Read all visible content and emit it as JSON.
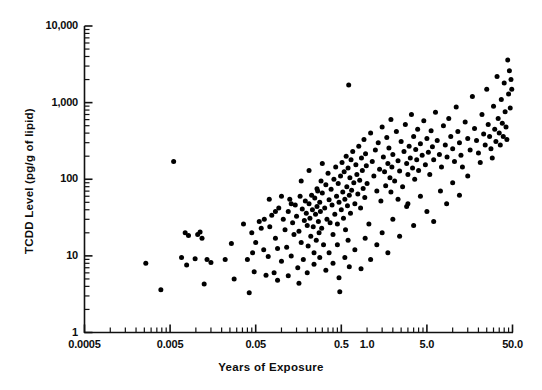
{
  "chart_data": {
    "type": "scatter",
    "title": "",
    "xlabel": "Years of Exposure",
    "ylabel": "TCDD Level (pg/g of lipid)",
    "xscale": "log",
    "yscale": "log",
    "xlim": [
      0.0005,
      50.0
    ],
    "ylim": [
      1,
      10000
    ],
    "grid": false,
    "legend": null,
    "marker": {
      "shape": "circle",
      "color": "#000000",
      "size_px": 5
    },
    "xticks": [
      {
        "value": 0.0005,
        "label": "0.0005"
      },
      {
        "value": 0.005,
        "label": "0.005"
      },
      {
        "value": 0.05,
        "label": "0.05"
      },
      {
        "value": 0.5,
        "label": "0.5"
      },
      {
        "value": 1.0,
        "label": "1.0"
      },
      {
        "value": 5.0,
        "label": "5.0"
      },
      {
        "value": 50.0,
        "label": "50.0"
      }
    ],
    "yticks": [
      {
        "value": 1,
        "label": "1"
      },
      {
        "value": 10,
        "label": "10"
      },
      {
        "value": 100,
        "label": "100"
      },
      {
        "value": 1000,
        "label": "1,000"
      },
      {
        "value": 10000,
        "label": "10,000"
      }
    ],
    "points": [
      [
        0.0026,
        8.0
      ],
      [
        0.0039,
        3.6
      ],
      [
        0.0055,
        170
      ],
      [
        0.0068,
        9.5
      ],
      [
        0.0075,
        20
      ],
      [
        0.0078,
        7.6
      ],
      [
        0.0082,
        18.5
      ],
      [
        0.0098,
        9.2
      ],
      [
        0.0105,
        19
      ],
      [
        0.0112,
        20.5
      ],
      [
        0.0118,
        17
      ],
      [
        0.0125,
        4.3
      ],
      [
        0.0135,
        9.0
      ],
      [
        0.015,
        8.2
      ],
      [
        0.022,
        9.0
      ],
      [
        0.026,
        14.5
      ],
      [
        0.028,
        5.0
      ],
      [
        0.036,
        26
      ],
      [
        0.04,
        9.0
      ],
      [
        0.042,
        3.3
      ],
      [
        0.045,
        20
      ],
      [
        0.046,
        11
      ],
      [
        0.048,
        6.2
      ],
      [
        0.05,
        15
      ],
      [
        0.055,
        28
      ],
      [
        0.058,
        23
      ],
      [
        0.062,
        12
      ],
      [
        0.063,
        30
      ],
      [
        0.066,
        5.6
      ],
      [
        0.07,
        9.8
      ],
      [
        0.073,
        24
      ],
      [
        0.077,
        34
      ],
      [
        0.082,
        6.0
      ],
      [
        0.085,
        17
      ],
      [
        0.09,
        12.5
      ],
      [
        0.093,
        42
      ],
      [
        0.1,
        8.5
      ],
      [
        0.105,
        30
      ],
      [
        0.11,
        22
      ],
      [
        0.115,
        13
      ],
      [
        0.12,
        38
      ],
      [
        0.125,
        55
      ],
      [
        0.13,
        10
      ],
      [
        0.135,
        27
      ],
      [
        0.14,
        19
      ],
      [
        0.145,
        46
      ],
      [
        0.15,
        33
      ],
      [
        0.155,
        7.0
      ],
      [
        0.16,
        21
      ],
      [
        0.165,
        60
      ],
      [
        0.17,
        15
      ],
      [
        0.175,
        41
      ],
      [
        0.18,
        9.0
      ],
      [
        0.185,
        29
      ],
      [
        0.19,
        52
      ],
      [
        0.195,
        36
      ],
      [
        0.2,
        25
      ],
      [
        0.205,
        13.5
      ],
      [
        0.21,
        48
      ],
      [
        0.215,
        31
      ],
      [
        0.22,
        18
      ],
      [
        0.225,
        62
      ],
      [
        0.23,
        40
      ],
      [
        0.235,
        24
      ],
      [
        0.24,
        11
      ],
      [
        0.245,
        57
      ],
      [
        0.25,
        35
      ],
      [
        0.255,
        16
      ],
      [
        0.26,
        44
      ],
      [
        0.265,
        70
      ],
      [
        0.27,
        28
      ],
      [
        0.275,
        20
      ],
      [
        0.28,
        50
      ],
      [
        0.285,
        38
      ],
      [
        0.29,
        95
      ],
      [
        0.295,
        23
      ],
      [
        0.3,
        66
      ],
      [
        0.31,
        14
      ],
      [
        0.32,
        42
      ],
      [
        0.33,
        85
      ],
      [
        0.34,
        30
      ],
      [
        0.35,
        120
      ],
      [
        0.36,
        54
      ],
      [
        0.37,
        27
      ],
      [
        0.38,
        74
      ],
      [
        0.39,
        46
      ],
      [
        0.4,
        19
      ],
      [
        0.41,
        100
      ],
      [
        0.42,
        35
      ],
      [
        0.43,
        145
      ],
      [
        0.44,
        60
      ],
      [
        0.45,
        26
      ],
      [
        0.46,
        88
      ],
      [
        0.47,
        50
      ],
      [
        0.48,
        3.4
      ],
      [
        0.49,
        110
      ],
      [
        0.5,
        40
      ],
      [
        0.51,
        165
      ],
      [
        0.52,
        68
      ],
      [
        0.53,
        31
      ],
      [
        0.54,
        125
      ],
      [
        0.55,
        55
      ],
      [
        0.56,
        22
      ],
      [
        0.57,
        200
      ],
      [
        0.58,
        80
      ],
      [
        0.59,
        45
      ],
      [
        0.6,
        140
      ],
      [
        0.61,
        1700
      ],
      [
        0.62,
        62
      ],
      [
        0.63,
        105
      ],
      [
        0.64,
        36
      ],
      [
        0.65,
        180
      ],
      [
        0.66,
        72
      ],
      [
        0.68,
        230
      ],
      [
        0.7,
        90
      ],
      [
        0.72,
        48
      ],
      [
        0.74,
        155
      ],
      [
        0.76,
        115
      ],
      [
        0.78,
        64
      ],
      [
        0.8,
        270
      ],
      [
        0.82,
        97
      ],
      [
        0.84,
        42
      ],
      [
        0.86,
        190
      ],
      [
        0.88,
        130
      ],
      [
        0.9,
        76
      ],
      [
        0.92,
        330
      ],
      [
        0.94,
        58
      ],
      [
        0.96,
        215
      ],
      [
        0.98,
        150
      ],
      [
        1.0,
        88
      ],
      [
        1.05,
        26
      ],
      [
        1.1,
        400
      ],
      [
        1.15,
        170
      ],
      [
        1.2,
        110
      ],
      [
        1.25,
        240
      ],
      [
        1.3,
        70
      ],
      [
        1.35,
        300
      ],
      [
        1.4,
        135
      ],
      [
        1.45,
        52
      ],
      [
        1.5,
        480
      ],
      [
        1.55,
        195
      ],
      [
        1.6,
        125
      ],
      [
        1.65,
        82
      ],
      [
        1.7,
        350
      ],
      [
        1.75,
        160
      ],
      [
        1.8,
        255
      ],
      [
        1.85,
        105
      ],
      [
        1.9,
        600
      ],
      [
        1.95,
        145
      ],
      [
        2.0,
        210
      ],
      [
        2.1,
        95
      ],
      [
        2.2,
        420
      ],
      [
        2.3,
        175
      ],
      [
        2.4,
        128
      ],
      [
        2.5,
        310
      ],
      [
        2.6,
        80
      ],
      [
        2.7,
        230
      ],
      [
        2.8,
        520
      ],
      [
        2.9,
        160
      ],
      [
        3.0,
        115
      ],
      [
        3.1,
        270
      ],
      [
        3.2,
        190
      ],
      [
        3.3,
        700
      ],
      [
        3.4,
        140
      ],
      [
        3.5,
        360
      ],
      [
        3.6,
        100
      ],
      [
        3.7,
        245
      ],
      [
        3.8,
        180
      ],
      [
        3.9,
        450
      ],
      [
        4.0,
        130
      ],
      [
        4.2,
        290
      ],
      [
        4.4,
        205
      ],
      [
        4.6,
        580
      ],
      [
        4.8,
        155
      ],
      [
        5.0,
        340
      ],
      [
        5.2,
        225
      ],
      [
        5.4,
        115
      ],
      [
        5.6,
        430
      ],
      [
        5.8,
        265
      ],
      [
        6.0,
        180
      ],
      [
        6.3,
        750
      ],
      [
        6.6,
        320
      ],
      [
        7.0,
        210
      ],
      [
        7.4,
        145
      ],
      [
        7.8,
        500
      ],
      [
        8.2,
        280
      ],
      [
        8.6,
        195
      ],
      [
        9.0,
        620
      ],
      [
        9.5,
        360
      ],
      [
        10.0,
        250
      ],
      [
        10.5,
        170
      ],
      [
        11.0,
        880
      ],
      [
        11.5,
        420
      ],
      [
        12.0,
        300
      ],
      [
        12.5,
        205
      ],
      [
        13.0,
        145
      ],
      [
        14.0,
        560
      ],
      [
        15.0,
        340
      ],
      [
        16.0,
        240
      ],
      [
        17.0,
        1200
      ],
      [
        18.0,
        460
      ],
      [
        19.0,
        320
      ],
      [
        20.0,
        220
      ],
      [
        21.0,
        165
      ],
      [
        22.0,
        700
      ],
      [
        23.0,
        390
      ],
      [
        24.0,
        280
      ],
      [
        25.0,
        1500
      ],
      [
        26.0,
        520
      ],
      [
        27.0,
        360
      ],
      [
        28.0,
        250
      ],
      [
        29.0,
        190
      ],
      [
        30.0,
        900
      ],
      [
        31.0,
        450
      ],
      [
        32.0,
        310
      ],
      [
        33.0,
        2200
      ],
      [
        34.0,
        620
      ],
      [
        35.0,
        400
      ],
      [
        36.0,
        280
      ],
      [
        37.0,
        1100
      ],
      [
        38.0,
        540
      ],
      [
        39.0,
        360
      ],
      [
        40.0,
        1800
      ],
      [
        41.0,
        760
      ],
      [
        42.0,
        480
      ],
      [
        43.0,
        330
      ],
      [
        44.0,
        3600
      ],
      [
        45.0,
        1300
      ],
      [
        46.0,
        2600
      ],
      [
        47.0,
        850
      ],
      [
        48.0,
        2000
      ],
      [
        49.0,
        1500
      ],
      [
        0.33,
        6.5
      ],
      [
        0.4,
        8.0
      ],
      [
        0.47,
        5.2
      ],
      [
        0.55,
        9.5
      ],
      [
        0.62,
        7.2
      ],
      [
        0.72,
        12
      ],
      [
        0.85,
        6.8
      ],
      [
        0.95,
        17
      ],
      [
        1.1,
        9.0
      ],
      [
        1.3,
        14
      ],
      [
        1.5,
        20
      ],
      [
        1.75,
        11
      ],
      [
        2.0,
        30
      ],
      [
        2.4,
        18
      ],
      [
        2.9,
        44
      ],
      [
        3.5,
        25
      ],
      [
        4.2,
        60
      ],
      [
        5.0,
        38
      ],
      [
        6.0,
        28
      ],
      [
        7.2,
        70
      ],
      [
        8.5,
        48
      ],
      [
        10.0,
        90
      ],
      [
        12.0,
        62
      ],
      [
        15.0,
        110
      ],
      [
        0.17,
        95
      ],
      [
        0.21,
        130
      ],
      [
        0.26,
        75
      ],
      [
        0.3,
        160
      ],
      [
        0.13,
        48
      ],
      [
        0.1,
        60
      ],
      [
        0.085,
        38
      ],
      [
        0.072,
        55
      ],
      [
        0.12,
        5.5
      ],
      [
        0.16,
        4.4
      ],
      [
        0.2,
        6.0
      ],
      [
        0.09,
        4.8
      ],
      [
        1.9,
        68
      ],
      [
        2.3,
        55
      ],
      [
        3.0,
        48
      ],
      [
        0.6,
        16
      ],
      [
        0.45,
        14
      ],
      [
        0.36,
        11
      ],
      [
        0.28,
        9.5
      ],
      [
        0.24,
        7.8
      ]
    ]
  },
  "axes": {
    "x_title": "Years of Exposure",
    "y_title": "TCDD Level (pg/g of lipid)"
  }
}
